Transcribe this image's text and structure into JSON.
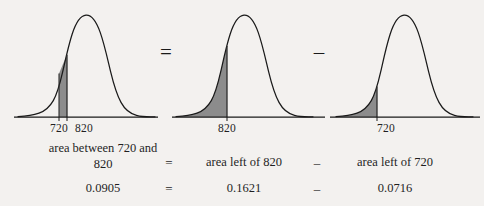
{
  "figure": {
    "background_color": "#f3f1ef",
    "curve_color": "#1a1a1a",
    "shade_color": "#8c8c8c",
    "curves": [
      {
        "name": "curve-between-720-and-820",
        "shade_type": "band",
        "tick_labels": [
          "720",
          "820"
        ],
        "shade_lower_label": "720",
        "shade_upper_label": "820"
      },
      {
        "name": "curve-left-of-820",
        "shade_type": "left-tail",
        "tick_labels": [
          "820"
        ],
        "shade_upper_label": "820"
      },
      {
        "name": "curve-left-of-720",
        "shade_type": "left-tail",
        "tick_labels": [
          "720"
        ],
        "shade_upper_label": "720"
      }
    ],
    "diagram_operators": [
      "=",
      "–"
    ],
    "caption_row": {
      "terms": [
        "area between 720 and 820",
        "area left of 820",
        "area left of 720"
      ],
      "operators": [
        "=",
        "–"
      ]
    },
    "value_row": {
      "values": [
        "0.0905",
        "0.1621",
        "0.0716"
      ],
      "operators": [
        "=",
        "–"
      ]
    }
  }
}
